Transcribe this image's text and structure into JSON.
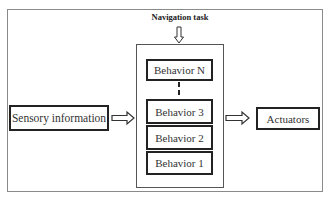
{
  "diagram": {
    "title": "Navigation task",
    "input": {
      "label": "Sensory information"
    },
    "output": {
      "label": "Actuators"
    },
    "behaviors": [
      {
        "label": "Behavior N"
      },
      {
        "label": "Behavior 3"
      },
      {
        "label": "Behavior 2"
      },
      {
        "label": "Behavior 1"
      }
    ],
    "connectors": {
      "task_to_stack": "hollow-down-arrow",
      "input_to_stack": "hollow-right-arrow",
      "stack_to_output": "hollow-right-arrow",
      "behavior_n_to_3": "dashed-line"
    },
    "colors": {
      "box_border": "#222222",
      "frame_border": "#8a8a8a",
      "text": "#333333",
      "background": "#ffffff"
    }
  }
}
